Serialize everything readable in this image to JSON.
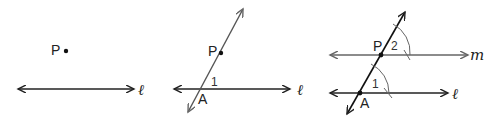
{
  "figure": {
    "panels": [
      {
        "id": "step-1",
        "point_label": "P",
        "line_label": "ℓ"
      },
      {
        "id": "step-2",
        "point_label": "P",
        "intersection_label": "A",
        "angle_label": "1",
        "line_label": "ℓ"
      },
      {
        "id": "step-3",
        "point_label": "P",
        "intersection_label": "A",
        "angle_1_label": "1",
        "angle_2_label": "2",
        "line_l_label": "ℓ",
        "line_m_label": "m"
      }
    ],
    "colors": {
      "line": "#222222",
      "construction": "#666666"
    }
  }
}
